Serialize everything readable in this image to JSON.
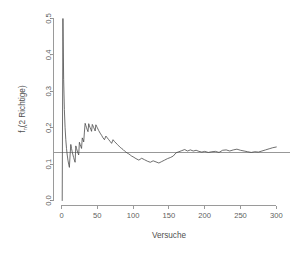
{
  "chart_data": {
    "type": "line",
    "title": "",
    "subtitle": "",
    "xlabel": "Versuche",
    "ylabel": "f_n(2 Richtige)",
    "ylabel_base": "f",
    "ylabel_subscript": "n",
    "ylabel_rest": "(2 Richtige)",
    "xlim": [
      0,
      310
    ],
    "ylim": [
      0.0,
      0.5
    ],
    "xticks": [
      0,
      50,
      100,
      150,
      200,
      250,
      300
    ],
    "xtick_labels": [
      "0",
      "50",
      "100",
      "150",
      "200",
      "250",
      "300"
    ],
    "yticks": [
      0.0,
      0.1,
      0.2,
      0.3,
      0.4,
      0.5
    ],
    "ytick_labels": [
      "0.0",
      "0.1",
      "0.2",
      "0.3",
      "0.4",
      "0.5"
    ],
    "grid": false,
    "legend": null,
    "line_color": "#4a4a4a",
    "reference_line_color": "#8d8d8d",
    "axis_color": "#9a9a9a",
    "annotations": [
      {
        "kind": "hline",
        "label": "theoretische Wahrscheinlichkeit",
        "y": 0.132
      }
    ],
    "reference_line_y": 0.132,
    "series": [
      {
        "name": "relative Haeufigkeit 2 Richtige",
        "x": [
          1,
          2,
          3,
          4,
          5,
          6,
          7,
          8,
          9,
          10,
          11,
          12,
          13,
          14,
          15,
          16,
          17,
          18,
          19,
          20,
          21,
          22,
          23,
          24,
          25,
          26,
          27,
          28,
          29,
          30,
          31,
          32,
          33,
          34,
          35,
          36,
          37,
          38,
          39,
          40,
          41,
          42,
          43,
          44,
          45,
          46,
          47,
          48,
          49,
          50,
          52,
          54,
          56,
          58,
          60,
          62,
          64,
          66,
          68,
          70,
          72,
          74,
          76,
          78,
          80,
          82,
          84,
          86,
          88,
          90,
          92,
          94,
          96,
          98,
          100,
          104,
          108,
          112,
          116,
          120,
          124,
          128,
          132,
          136,
          140,
          144,
          148,
          152,
          156,
          160,
          164,
          168,
          172,
          176,
          180,
          184,
          188,
          192,
          196,
          200,
          205,
          210,
          215,
          220,
          225,
          230,
          235,
          240,
          245,
          250,
          255,
          260,
          265,
          270,
          275,
          280,
          285,
          290,
          295,
          300
        ],
        "values": [
          0.0,
          0.5,
          0.333,
          0.25,
          0.2,
          0.167,
          0.143,
          0.125,
          0.111,
          0.1,
          0.091,
          0.125,
          0.154,
          0.143,
          0.133,
          0.125,
          0.118,
          0.111,
          0.105,
          0.15,
          0.143,
          0.136,
          0.13,
          0.125,
          0.16,
          0.154,
          0.148,
          0.143,
          0.172,
          0.167,
          0.161,
          0.188,
          0.212,
          0.206,
          0.2,
          0.194,
          0.189,
          0.211,
          0.205,
          0.2,
          0.195,
          0.19,
          0.209,
          0.205,
          0.2,
          0.196,
          0.191,
          0.208,
          0.204,
          0.2,
          0.192,
          0.185,
          0.179,
          0.172,
          0.167,
          0.177,
          0.172,
          0.167,
          0.162,
          0.157,
          0.167,
          0.162,
          0.158,
          0.154,
          0.15,
          0.146,
          0.143,
          0.14,
          0.136,
          0.133,
          0.13,
          0.128,
          0.125,
          0.122,
          0.12,
          0.115,
          0.111,
          0.116,
          0.112,
          0.108,
          0.105,
          0.109,
          0.106,
          0.103,
          0.107,
          0.111,
          0.115,
          0.118,
          0.122,
          0.131,
          0.134,
          0.137,
          0.14,
          0.136,
          0.139,
          0.136,
          0.138,
          0.135,
          0.133,
          0.135,
          0.132,
          0.134,
          0.135,
          0.132,
          0.138,
          0.139,
          0.136,
          0.139,
          0.141,
          0.138,
          0.136,
          0.134,
          0.132,
          0.134,
          0.133,
          0.136,
          0.139,
          0.142,
          0.145,
          0.147
        ]
      }
    ]
  }
}
